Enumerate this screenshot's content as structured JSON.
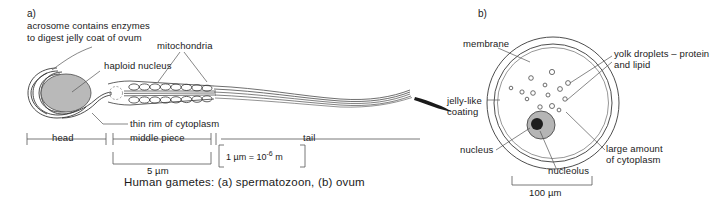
{
  "figure": {
    "caption": "Human gametes: (a) spermatozoon, (b) ovum",
    "background_color": "#ffffff",
    "line_color": "#2b2b2b",
    "nucleus_fill": "#b9b9b9",
    "nucleolus_fill": "#1e1e1e"
  },
  "panel_a": {
    "id": "a)",
    "labels": {
      "acrosome_line1": "acrosome contains enzymes",
      "acrosome_line2": "to digest jelly coat of ovum",
      "haploid_nucleus": "haploid nucleus",
      "mitochondria": "mitochondria",
      "thin_rim": "thin rim of cytoplasm"
    },
    "regions": {
      "head": "head",
      "middle_piece": "middle piece",
      "tail": "tail"
    },
    "scale_bar": "5 µm",
    "scale_note": {
      "prefix": "1 µm = 10",
      "exponent": "-6",
      "suffix": " m"
    },
    "mitochondria_count_per_row": 9,
    "mitochondria_rows": 2
  },
  "panel_b": {
    "id": "b)",
    "labels": {
      "membrane": "membrane",
      "yolk_line1": "yolk droplets – protein",
      "yolk_line2": "and lipid",
      "jelly_line1": "jelly-like",
      "jelly_line2": "coating",
      "nucleus": "nucleus",
      "nucleolus": "nucleolus",
      "cytoplasm_line1": "large amount",
      "cytoplasm_line2": "of cytoplasm"
    },
    "scale_bar": "100 µm",
    "yolk_droplet_count": 14
  }
}
